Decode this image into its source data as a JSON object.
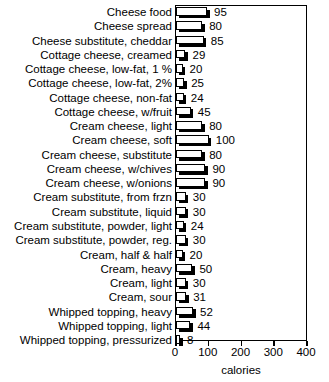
{
  "chart_data": {
    "type": "bar",
    "orientation": "horizontal",
    "title": "",
    "xlabel": "calories",
    "ylabel": "",
    "xlim": [
      0,
      400
    ],
    "xticks": [
      0,
      100,
      200,
      300,
      400
    ],
    "grid": false,
    "legend": null,
    "categories": [
      "Cheese food",
      "Cheese spread",
      "Cheese substitute, cheddar",
      "Cottage cheese, creamed",
      "Cottage cheese, low-fat, 1 %",
      "Cottage cheese, low-fat, 2%",
      "Cottage cheese, non-fat",
      "Cottage cheese, w/fruit",
      "Cream cheese, light",
      "Cream cheese, soft",
      "Cream cheese, substitute",
      "Cream cheese, w/chives",
      "Cream cheese, w/onions",
      "Cream substitute, from frzn",
      "Cream substitute, liquid",
      "Cream substitute, powder, light",
      "Cream substitute, powder, reg.",
      "Cream, half & half",
      "Cream, heavy",
      "Cream, light",
      "Cream, sour",
      "Whipped topping, heavy",
      "Whipped topping, light",
      "Whipped topping, pressurized"
    ],
    "values": [
      95,
      80,
      85,
      29,
      20,
      25,
      24,
      45,
      80,
      100,
      80,
      90,
      90,
      30,
      30,
      24,
      30,
      20,
      50,
      30,
      31,
      52,
      44,
      8
    ],
    "value_labels": [
      "95",
      "80",
      "85",
      "29",
      "20",
      "25",
      "24",
      "45",
      "80",
      "100",
      "80",
      "90",
      "90",
      "30",
      "30",
      "24",
      "30",
      "20",
      "50",
      "30",
      "31",
      "52",
      "44",
      "8"
    ],
    "xtick_labels": [
      "0",
      "100",
      "200",
      "300",
      "400"
    ]
  }
}
